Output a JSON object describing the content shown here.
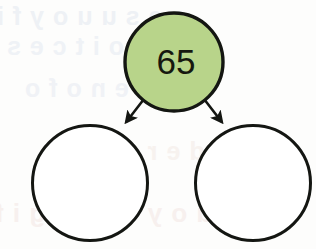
{
  "worksheet": {
    "type": "number-bond-diagram",
    "title": "Number Bond",
    "canvas": {
      "width": 316,
      "height": 249
    },
    "background_color": "#fdfdfc"
  },
  "diagram": {
    "parent_node": {
      "label": "65",
      "value": 65,
      "filled": true,
      "fill_color": "#b8d48a",
      "stroke_color": "#141612",
      "center_x": 174,
      "center_y": 62,
      "radius": 50
    },
    "child_nodes": [
      {
        "label": "",
        "value": null,
        "filled": false,
        "fill_color": "#ffffff",
        "stroke_color": "#141612",
        "center_x": 90,
        "center_y": 183,
        "radius": 58,
        "position": "left"
      },
      {
        "label": "",
        "value": null,
        "filled": false,
        "fill_color": "#ffffff",
        "stroke_color": "#141612",
        "center_x": 253,
        "center_y": 183,
        "radius": 58,
        "position": "right"
      }
    ],
    "connectors": [
      {
        "name": "arrow-to-left-child",
        "from_x": 144,
        "from_y": 99,
        "to_x": 126,
        "to_y": 122,
        "color": "#141612"
      },
      {
        "name": "arrow-to-right-child",
        "from_x": 204,
        "from_y": 99,
        "to_x": 222,
        "to_y": 122,
        "color": "#141612"
      }
    ]
  },
  "background_text": {
    "description": "faint mirrored show-through text from reverse side of page",
    "lines": [
      "s e s u  u o y  f i",
      "n i  s n o i t c e s",
      "r e t  e n o  f o",
      "5 6  o t  d e r d n u h",
      "u o y  o  e r u g i f"
    ]
  }
}
